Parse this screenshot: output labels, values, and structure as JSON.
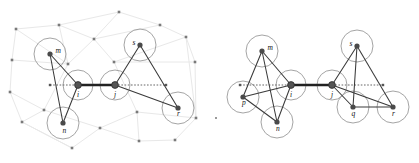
{
  "figure": {
    "title": "",
    "width": 419,
    "height": 163,
    "background_color": "#ffffff",
    "panels": [
      {
        "id": "left",
        "name": "left-panel",
        "has_background_mesh": true,
        "mesh_color": "#e8e8e8",
        "mesh_node_color": "#7a7a7a",
        "halo_color": "#9a9a9a",
        "edge_color": "#3a3a3a",
        "hub_edge_color": "#222222",
        "dotted_color": "#555555",
        "nodes": [
          {
            "label": "m",
            "x": 50,
            "y": 54,
            "r": 2.6,
            "halo": 16,
            "label_dx": 5.5,
            "label_dy": -1.5,
            "type": "normal"
          },
          {
            "label": "n",
            "x": 63,
            "y": 123,
            "r": 2.6,
            "halo": 16,
            "label_dx": -0.5,
            "label_dy": 9.5,
            "type": "normal"
          },
          {
            "label": "i",
            "x": 78,
            "y": 85,
            "r": 3.4,
            "halo": 15,
            "label_dx": -1.0,
            "label_dy": 11.5,
            "type": "hub"
          },
          {
            "label": "j",
            "x": 115,
            "y": 85,
            "r": 3.4,
            "halo": 15,
            "label_dx": -1.0,
            "label_dy": 11.5,
            "type": "hub"
          },
          {
            "label": "s",
            "x": 140,
            "y": 45,
            "r": 2.6,
            "halo": 16,
            "label_dx": -7.5,
            "label_dy": -0.5,
            "type": "normal"
          },
          {
            "label": "r",
            "x": 178,
            "y": 108,
            "r": 2.6,
            "halo": 16,
            "label_dx": -1.0,
            "label_dy": 7.5,
            "type": "normal"
          }
        ],
        "edges": [
          {
            "from": "m",
            "to": "i",
            "style": "solid"
          },
          {
            "from": "m",
            "to": "n",
            "style": "solid"
          },
          {
            "from": "n",
            "to": "i",
            "style": "solid"
          },
          {
            "from": "i",
            "to": "j",
            "style": "thick"
          },
          {
            "from": "j",
            "to": "s",
            "style": "solid"
          },
          {
            "from": "j",
            "to": "r",
            "style": "solid"
          },
          {
            "from": "s",
            "to": "r",
            "style": "solid"
          }
        ],
        "dotted_lines": [
          {
            "x1": 50,
            "y1": 85,
            "x2": 78,
            "y2": 85
          },
          {
            "x1": 115,
            "y1": 85,
            "x2": 166,
            "y2": 85
          }
        ],
        "mesh_nodes": [
          {
            "x": 16,
            "y": 29
          },
          {
            "x": 59,
            "y": 25
          },
          {
            "x": 94,
            "y": 39
          },
          {
            "x": 119,
            "y": 12
          },
          {
            "x": 160,
            "y": 25
          },
          {
            "x": 186,
            "y": 37
          },
          {
            "x": 195,
            "y": 62
          },
          {
            "x": 12,
            "y": 60
          },
          {
            "x": 10,
            "y": 92
          },
          {
            "x": 22,
            "y": 122
          },
          {
            "x": 44,
            "y": 110
          },
          {
            "x": 72,
            "y": 148
          },
          {
            "x": 100,
            "y": 128
          },
          {
            "x": 139,
            "y": 141
          },
          {
            "x": 137,
            "y": 112
          },
          {
            "x": 196,
            "y": 118
          },
          {
            "x": 175,
            "y": 140
          },
          {
            "x": 68,
            "y": 64
          },
          {
            "x": 114,
            "y": 62
          }
        ],
        "mesh_edges": [
          [
            0,
            1
          ],
          [
            1,
            3
          ],
          [
            3,
            4
          ],
          [
            4,
            5
          ],
          [
            5,
            6
          ],
          [
            0,
            7
          ],
          [
            7,
            8
          ],
          [
            8,
            9
          ],
          [
            9,
            11
          ],
          [
            11,
            12
          ],
          [
            12,
            13
          ],
          [
            13,
            16
          ],
          [
            16,
            15
          ],
          [
            15,
            6
          ],
          [
            1,
            2
          ],
          [
            2,
            3
          ],
          [
            2,
            4
          ],
          [
            2,
            17
          ],
          [
            17,
            0
          ],
          [
            17,
            7
          ],
          [
            17,
            10
          ],
          [
            10,
            9
          ],
          [
            10,
            12
          ],
          [
            2,
            18
          ],
          [
            18,
            5
          ],
          [
            18,
            14
          ],
          [
            14,
            12
          ],
          [
            14,
            15
          ],
          [
            14,
            13
          ],
          [
            5,
            15
          ],
          [
            1,
            17
          ],
          [
            8,
            10
          ],
          [
            11,
            9
          ],
          [
            6,
            18
          ]
        ]
      },
      {
        "id": "right",
        "name": "right-panel",
        "has_background_mesh": false,
        "halo_color": "#9a9a9a",
        "edge_color": "#3a3a3a",
        "hub_edge_color": "#222222",
        "dotted_color": "#555555",
        "nodes": [
          {
            "label": "m",
            "x": 47,
            "y": 51,
            "r": 2.6,
            "halo": 16,
            "label_dx": 5.5,
            "label_dy": -1.0,
            "type": "normal"
          },
          {
            "label": "p",
            "x": 28,
            "y": 97,
            "r": 2.6,
            "halo": 16,
            "label_dx": -1.0,
            "label_dy": 8.0,
            "type": "normal"
          },
          {
            "label": "n",
            "x": 62,
            "y": 122,
            "r": 2.6,
            "halo": 16,
            "label_dx": -1.0,
            "label_dy": 9.0,
            "type": "normal"
          },
          {
            "label": "i",
            "x": 76,
            "y": 85,
            "r": 3.4,
            "halo": 15,
            "label_dx": -1.0,
            "label_dy": 11.5,
            "type": "hub"
          },
          {
            "label": "j",
            "x": 117,
            "y": 85,
            "r": 3.4,
            "halo": 15,
            "label_dx": -1.0,
            "label_dy": 11.5,
            "type": "hub"
          },
          {
            "label": "s",
            "x": 142,
            "y": 46,
            "r": 2.6,
            "halo": 16,
            "label_dx": -7.5,
            "label_dy": -0.5,
            "type": "normal"
          },
          {
            "label": "q",
            "x": 138,
            "y": 107,
            "r": 2.6,
            "halo": 16,
            "label_dx": -1.5,
            "label_dy": 9.0,
            "type": "normal"
          },
          {
            "label": "r",
            "x": 178,
            "y": 107,
            "r": 2.6,
            "halo": 16,
            "label_dx": -1.0,
            "label_dy": 8.5,
            "type": "normal"
          }
        ],
        "edges": [
          {
            "from": "m",
            "to": "i",
            "style": "solid"
          },
          {
            "from": "m",
            "to": "p",
            "style": "solid"
          },
          {
            "from": "m",
            "to": "n",
            "style": "solid"
          },
          {
            "from": "p",
            "to": "n",
            "style": "solid"
          },
          {
            "from": "p",
            "to": "i",
            "style": "solid"
          },
          {
            "from": "n",
            "to": "i",
            "style": "solid"
          },
          {
            "from": "i",
            "to": "j",
            "style": "thick"
          },
          {
            "from": "j",
            "to": "s",
            "style": "solid"
          },
          {
            "from": "j",
            "to": "q",
            "style": "solid"
          },
          {
            "from": "j",
            "to": "r",
            "style": "solid"
          },
          {
            "from": "s",
            "to": "q",
            "style": "solid"
          },
          {
            "from": "s",
            "to": "r",
            "style": "solid"
          },
          {
            "from": "q",
            "to": "r",
            "style": "solid"
          }
        ],
        "dotted_lines": [
          {
            "x1": 25,
            "y1": 85,
            "x2": 76,
            "y2": 85
          },
          {
            "x1": 117,
            "y1": 85,
            "x2": 168,
            "y2": 85
          }
        ],
        "mesh_nodes": [],
        "mesh_edges": []
      }
    ],
    "stray_marks": [
      {
        "name": "stray-dot-left-margin",
        "x": 216,
        "y": 118,
        "r": 1.2
      }
    ]
  }
}
